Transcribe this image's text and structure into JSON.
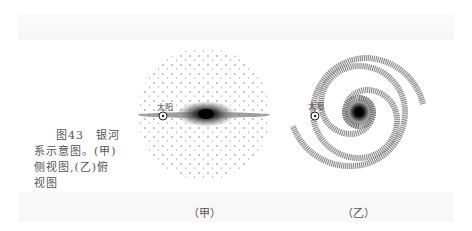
{
  "caption": {
    "line1": "图43　银河",
    "line2": "系示意图。(甲)",
    "line3": "侧视图,(乙)俯",
    "line4": "视图"
  },
  "figures": [
    {
      "id": "jia",
      "label": "（甲）",
      "sun_label": "太阳",
      "view": "side"
    },
    {
      "id": "yi",
      "label": "（乙）",
      "sun_label": "太阳",
      "view": "top"
    }
  ],
  "colors": {
    "ink": "#333333",
    "paper": "#ffffff"
  }
}
